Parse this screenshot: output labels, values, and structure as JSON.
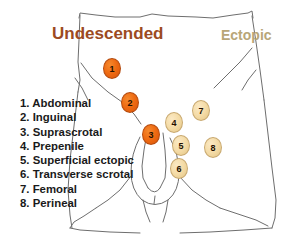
{
  "headings": {
    "undescended": "Undescended",
    "ectopic": "Ectopic"
  },
  "legend": {
    "items": [
      "1. Abdominal",
      "2. Inguinal",
      "3. Suprascrotal",
      "4. Prepenile",
      "5. Superficial ectopic",
      "6. Transverse scrotal",
      "7. Femoral",
      "8. Perineal"
    ]
  },
  "markers": [
    {
      "label": "1",
      "x": 103,
      "y": 58,
      "style": "orange"
    },
    {
      "label": "2",
      "x": 121,
      "y": 92,
      "style": "orange"
    },
    {
      "label": "3",
      "x": 142,
      "y": 124,
      "style": "orange"
    },
    {
      "label": "4",
      "x": 165,
      "y": 112,
      "style": "cream"
    },
    {
      "label": "5",
      "x": 172,
      "y": 135,
      "style": "cream"
    },
    {
      "label": "6",
      "x": 170,
      "y": 158,
      "style": "cream"
    },
    {
      "label": "7",
      "x": 192,
      "y": 100,
      "style": "cream"
    },
    {
      "label": "8",
      "x": 204,
      "y": 137,
      "style": "cream"
    }
  ],
  "colors": {
    "undescended_heading": "#9c4a22",
    "ectopic_heading": "#b8a678",
    "marker_orange": "#ee6a12",
    "marker_cream": "#f4dba6",
    "outline": "#6e6e6e"
  }
}
